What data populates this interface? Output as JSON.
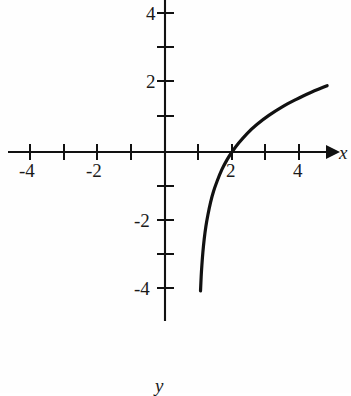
{
  "figure": {
    "background_color": "#fefefe",
    "ink_color": "#111111"
  },
  "axes": {
    "x_axis_label": "x",
    "y_axis_label": "y",
    "x_ticks_labeled": [
      "-4",
      "-2",
      "2",
      "4"
    ],
    "y_ticks_labeled": [
      "4",
      "2",
      "-2",
      "-4"
    ],
    "x_tick_values": [
      -4,
      -3,
      -2,
      -1,
      1,
      2,
      3,
      4
    ],
    "y_tick_values": [
      4,
      3,
      2,
      1,
      -1,
      -2,
      -3,
      -4
    ],
    "x_axis_arrow": "arrow-right",
    "y_axis_arrow": "none"
  },
  "chart_data": {
    "type": "line",
    "title": "",
    "xlabel": "x",
    "ylabel": "y",
    "xlim": [
      -4.8,
      5.5
    ],
    "ylim": [
      -4.7,
      4.5
    ],
    "grid": false,
    "legend": "none",
    "curve_description": "logarithmic curve with vertical asymptote at x = 1, increasing, crossing the x-axis at x = 2",
    "asymptote_x": 1,
    "x_intercept": 2,
    "series": [
      {
        "name": "y = log2(x - 1)",
        "x": [
          1.06,
          1.08,
          1.1,
          1.13,
          1.17,
          1.22,
          1.28,
          1.36,
          1.45,
          1.56,
          1.7,
          1.85,
          2.0,
          2.2,
          2.45,
          2.75,
          3.1,
          3.5,
          3.9,
          4.3,
          4.84
        ],
        "y": [
          -4.06,
          -3.64,
          -3.32,
          -2.94,
          -2.55,
          -2.18,
          -1.84,
          -1.47,
          -1.15,
          -0.84,
          -0.51,
          -0.23,
          0.0,
          0.26,
          0.54,
          0.81,
          1.07,
          1.32,
          1.53,
          1.72,
          1.94
        ]
      }
    ]
  },
  "tick_labels": {
    "x_neg4": "-4",
    "x_neg2": "-2",
    "x_pos2": "2",
    "x_pos4": "4",
    "y_pos4": "4",
    "y_pos2": "2",
    "y_neg2": "-2",
    "y_neg4": "-4"
  }
}
